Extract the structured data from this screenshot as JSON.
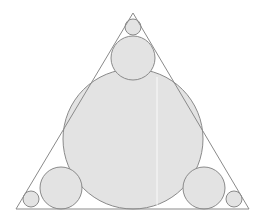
{
  "figure": {
    "title": "Circle packing inscribed in an isosceles triangle",
    "background_color": "#ffffff",
    "canvas": {
      "width": 262,
      "height": 220
    }
  },
  "style": {
    "circle_fill": "#e3e3e3",
    "circle_stroke": "#8a8a8a",
    "circle_stroke_width": 1,
    "triangle_fill": "none",
    "triangle_stroke": "#8a8a8a",
    "triangle_stroke_width": 1,
    "seam_color": "#f6f6f6",
    "seam_width": 1.2
  },
  "triangle": {
    "name": "outer-triangle",
    "vertices": [
      {
        "label": "apex",
        "x": 133,
        "y": 13
      },
      {
        "label": "bottom-left",
        "x": 16,
        "y": 209
      },
      {
        "label": "bottom-right",
        "x": 249,
        "y": 209
      }
    ],
    "points_attr": "133,13 16,209 249,209"
  },
  "circles": [
    {
      "name": "incircle-large",
      "cx": 133,
      "cy": 139,
      "r": 70,
      "role": "incircle"
    },
    {
      "name": "circle-upper-middle",
      "cx": 133,
      "cy": 58,
      "r": 22,
      "role": "apex-side"
    },
    {
      "name": "circle-bottom-left",
      "cx": 61,
      "cy": 188,
      "r": 21,
      "role": "corner-side"
    },
    {
      "name": "circle-bottom-right",
      "cx": 204,
      "cy": 188,
      "r": 21,
      "role": "corner-side"
    },
    {
      "name": "circle-apex-small",
      "cx": 133,
      "cy": 27,
      "r": 8,
      "role": "vertex"
    },
    {
      "name": "circle-corner-small-left",
      "cx": 31,
      "cy": 199,
      "r": 8,
      "role": "vertex"
    },
    {
      "name": "circle-corner-small-right",
      "cx": 234,
      "cy": 199,
      "r": 8,
      "role": "vertex"
    }
  ],
  "seam": {
    "name": "vertical-seam-artifact",
    "x": 157,
    "y1": 77,
    "y2": 205
  }
}
